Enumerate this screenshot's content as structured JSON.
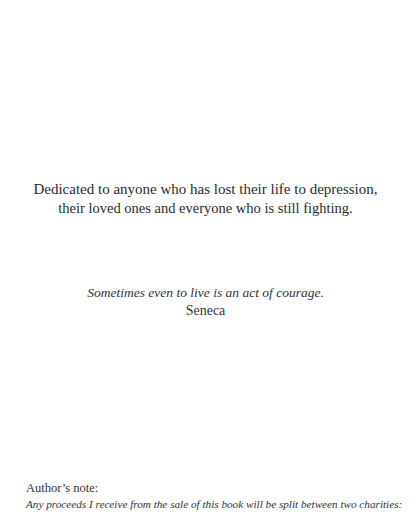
{
  "dedication": {
    "line1": "Dedicated to anyone who has lost their life to depression,",
    "line2": "their loved ones and everyone who is still fighting."
  },
  "epigraph": {
    "quote": "Sometimes even to live is an act of  courage.",
    "attribution": "Seneca"
  },
  "authors_note": {
    "label": "Author’s note:",
    "text": "Any proceeds I receive from the sale of  this book will be split between two charities:"
  }
}
